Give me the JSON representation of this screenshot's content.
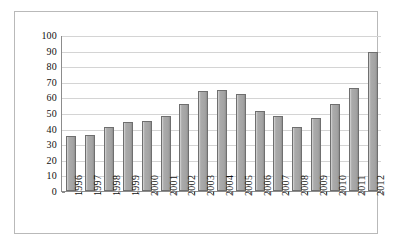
{
  "chart_data": {
    "type": "bar",
    "title": "",
    "subtitle": "",
    "xlabel": "",
    "ylabel": "",
    "categories": [
      "1996",
      "1997",
      "1998",
      "1999",
      "2000",
      "2001",
      "2002",
      "2003",
      "2004",
      "2005",
      "2006",
      "2007",
      "2008",
      "2009",
      "2010",
      "2011",
      "2012"
    ],
    "values": [
      35,
      36,
      41,
      44,
      45,
      48,
      56,
      64,
      65,
      62,
      51,
      48,
      41,
      47,
      56,
      66,
      89
    ],
    "series": [
      {
        "name": "Series 1",
        "values": [
          35,
          36,
          41,
          44,
          45,
          48,
          56,
          64,
          65,
          62,
          51,
          48,
          41,
          47,
          56,
          66,
          89
        ]
      }
    ],
    "ylim": [
      0,
      100
    ],
    "ytick_step": 10,
    "ytick_labels": [
      "100",
      "90",
      "80",
      "70",
      "60",
      "50",
      "40",
      "30",
      "20",
      "10",
      "0"
    ],
    "grid": true,
    "grid_axis": "y",
    "legend": false,
    "legend_position": "none",
    "annotations": [],
    "colors": {
      "bar_fill": "#a8a8a8",
      "bar_edge": "#6f6f6f",
      "gridline": "#d4d4d4",
      "axis_line": "#8c8c8c",
      "frame": "#b9b9b9",
      "plot_background": "#ffffff",
      "text": "#111111"
    }
  }
}
